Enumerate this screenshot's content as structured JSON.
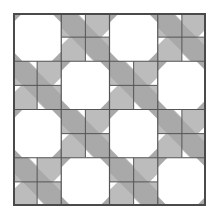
{
  "image": {
    "subject": "quilt block pattern",
    "grid": {
      "rows": 4,
      "cols": 4
    },
    "block_layout": [
      [
        "octagon",
        "four-patch",
        "octagon",
        "four-patch"
      ],
      [
        "four-patch",
        "octagon",
        "four-patch",
        "octagon"
      ],
      [
        "octagon",
        "four-patch",
        "octagon",
        "four-patch"
      ],
      [
        "four-patch",
        "octagon",
        "four-patch",
        "octagon"
      ]
    ],
    "colors": {
      "background": "#ffffff",
      "light_gray": "#bcbcbc",
      "band_gray": "#a9a9a9",
      "octagon_fill": "#ffffff",
      "seam_line": "#555555",
      "border": "#4a4a4a"
    }
  }
}
